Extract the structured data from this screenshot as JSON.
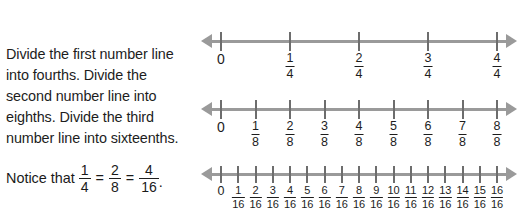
{
  "instructions": {
    "paragraph": "Divide the first number line into fourths. Divide the second number line into eighths. Divide the third number line into sixteenths.",
    "notice_prefix": "Notice that",
    "equals": "=",
    "period": ".",
    "notice_fractions": [
      {
        "num": "1",
        "den": "4"
      },
      {
        "num": "2",
        "den": "8"
      },
      {
        "num": "4",
        "den": "16"
      }
    ]
  },
  "colors": {
    "axis": "#9a9a9a",
    "tick": "#6d6d6d",
    "text": "#1d1d1d",
    "background": "#ffffff"
  },
  "number_lines": [
    {
      "id": "fourths",
      "denominator": "4",
      "divisions": 4,
      "labels": [
        {
          "type": "whole",
          "whole": "0"
        },
        {
          "type": "fraction",
          "num": "1",
          "den": "4"
        },
        {
          "type": "fraction",
          "num": "2",
          "den": "4"
        },
        {
          "type": "fraction",
          "num": "3",
          "den": "4"
        },
        {
          "type": "fraction",
          "num": "4",
          "den": "4"
        }
      ]
    },
    {
      "id": "eighths",
      "denominator": "8",
      "divisions": 8,
      "labels": [
        {
          "type": "whole",
          "whole": "0"
        },
        {
          "type": "fraction",
          "num": "1",
          "den": "8"
        },
        {
          "type": "fraction",
          "num": "2",
          "den": "8"
        },
        {
          "type": "fraction",
          "num": "3",
          "den": "8"
        },
        {
          "type": "fraction",
          "num": "4",
          "den": "8"
        },
        {
          "type": "fraction",
          "num": "5",
          "den": "8"
        },
        {
          "type": "fraction",
          "num": "6",
          "den": "8"
        },
        {
          "type": "fraction",
          "num": "7",
          "den": "8"
        },
        {
          "type": "fraction",
          "num": "8",
          "den": "8"
        }
      ]
    },
    {
      "id": "sixteenths",
      "denominator": "16",
      "divisions": 16,
      "labels": [
        {
          "type": "whole",
          "whole": "0"
        },
        {
          "type": "fraction",
          "num": "1",
          "den": "16"
        },
        {
          "type": "fraction",
          "num": "2",
          "den": "16"
        },
        {
          "type": "fraction",
          "num": "3",
          "den": "16"
        },
        {
          "type": "fraction",
          "num": "4",
          "den": "16"
        },
        {
          "type": "fraction",
          "num": "5",
          "den": "16"
        },
        {
          "type": "fraction",
          "num": "6",
          "den": "16"
        },
        {
          "type": "fraction",
          "num": "7",
          "den": "16"
        },
        {
          "type": "fraction",
          "num": "8",
          "den": "16"
        },
        {
          "type": "fraction",
          "num": "9",
          "den": "16"
        },
        {
          "type": "fraction",
          "num": "10",
          "den": "16"
        },
        {
          "type": "fraction",
          "num": "11",
          "den": "16"
        },
        {
          "type": "fraction",
          "num": "12",
          "den": "16"
        },
        {
          "type": "fraction",
          "num": "13",
          "den": "16"
        },
        {
          "type": "fraction",
          "num": "14",
          "den": "16"
        },
        {
          "type": "fraction",
          "num": "15",
          "den": "16"
        },
        {
          "type": "fraction",
          "num": "16",
          "den": "16"
        }
      ]
    }
  ],
  "geometry": {
    "tick_start_x": 221,
    "tick_end_x": 497
  }
}
